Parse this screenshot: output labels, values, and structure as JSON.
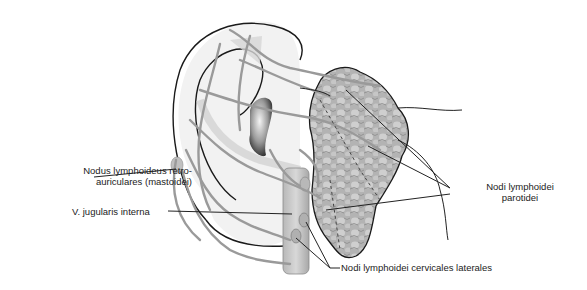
{
  "figure": {
    "labels": {
      "mastoid_line1": "Nodus lymphoideus retro-",
      "mastoid_line2": "auriculares (mastoidei)",
      "jugular": "V. jugularis interna",
      "parotid_line1": "Nodi lymphoidei",
      "parotid_line2": "parotidei",
      "cervical": "Nodi lymphoidei cervicales laterales"
    },
    "colors": {
      "outline": "#1a1a1a",
      "vessel": "#9a9a9a",
      "gland": "#a8a8a8",
      "skin": "#efefef",
      "shadow": "#c8c8c8"
    }
  }
}
